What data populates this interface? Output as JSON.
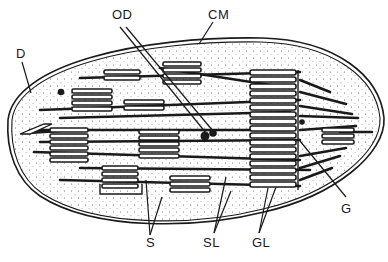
{
  "diagram": {
    "colors": {
      "ink": "#1a1a1a",
      "stroma_fill": "#f2f2f2",
      "background": "#ffffff"
    },
    "labels": [
      {
        "id": "OD",
        "text": "OD",
        "meaning": "osmiophilic droplets",
        "x": 112,
        "y": 8
      },
      {
        "id": "CM",
        "text": "CM",
        "meaning": "chloroplast membrane",
        "x": 208,
        "y": 8
      },
      {
        "id": "D",
        "text": "D",
        "meaning": "D",
        "x": 16,
        "y": 47
      },
      {
        "id": "G",
        "text": "G",
        "meaning": "granum",
        "x": 341,
        "y": 202
      },
      {
        "id": "S",
        "text": "S",
        "meaning": "stroma",
        "x": 146,
        "y": 236
      },
      {
        "id": "SL",
        "text": "SL",
        "meaning": "stroma lamellae",
        "x": 203,
        "y": 236
      },
      {
        "id": "GL",
        "text": "GL",
        "meaning": "grana lamellae",
        "x": 252,
        "y": 236
      }
    ]
  }
}
